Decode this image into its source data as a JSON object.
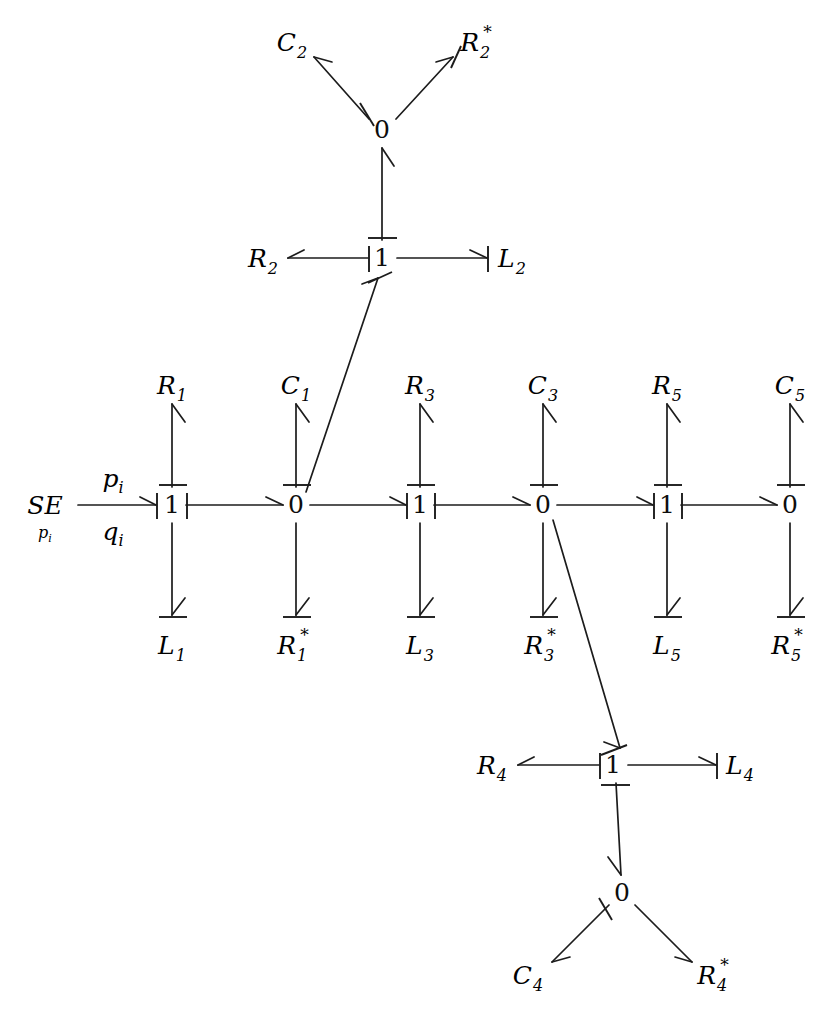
{
  "diagram": {
    "kind": "bond-graph",
    "title": "",
    "stroke_color": "#1c1c1c",
    "text_color": "#0d0d0d",
    "background": "#ffffff",
    "source": {
      "label": "SE",
      "subscript": "p",
      "subscript_sub": "i",
      "bond_effort_label": "p",
      "bond_effort_sub": "i",
      "bond_flow_label": "q",
      "bond_flow_sub": "i"
    },
    "junctions": {
      "main_row": [
        "1",
        "0",
        "1",
        "0",
        "1",
        "0"
      ],
      "top_one": "1",
      "top_zero": "0",
      "bottom_one": "1",
      "bottom_zero": "0"
    },
    "elements": {
      "top_row": [
        {
          "base": "R",
          "sub": "1",
          "star": false
        },
        {
          "base": "C",
          "sub": "1",
          "star": false
        },
        {
          "base": "R",
          "sub": "3",
          "star": false
        },
        {
          "base": "C",
          "sub": "3",
          "star": false
        },
        {
          "base": "R",
          "sub": "5",
          "star": false
        },
        {
          "base": "C",
          "sub": "5",
          "star": false
        }
      ],
      "bottom_row": [
        {
          "base": "L",
          "sub": "1",
          "star": false
        },
        {
          "base": "R",
          "sub": "1",
          "star": true
        },
        {
          "base": "L",
          "sub": "3",
          "star": false
        },
        {
          "base": "R",
          "sub": "3",
          "star": true
        },
        {
          "base": "L",
          "sub": "5",
          "star": false
        },
        {
          "base": "R",
          "sub": "5",
          "star": true
        }
      ],
      "top_cluster": [
        {
          "base": "C",
          "sub": "2",
          "star": false
        },
        {
          "base": "R",
          "sub": "2",
          "star": true
        },
        {
          "base": "R",
          "sub": "2",
          "star": false
        },
        {
          "base": "L",
          "sub": "2",
          "star": false
        }
      ],
      "bottom_cluster": [
        {
          "base": "C",
          "sub": "4",
          "star": false
        },
        {
          "base": "R",
          "sub": "4",
          "star": true
        },
        {
          "base": "R",
          "sub": "4",
          "star": false
        },
        {
          "base": "L",
          "sub": "4",
          "star": false
        }
      ]
    },
    "labels": {
      "SE": "SE",
      "p_i": "pi",
      "q_i": "qi",
      "R1": "R1",
      "C1": "C1",
      "R3": "R3",
      "C3": "C3",
      "R5": "R5",
      "C5": "C5",
      "L1": "L1",
      "R1s": "R1*",
      "L3": "L3",
      "R3s": "R3*",
      "L5": "L5",
      "R5s": "R5*",
      "C2": "C2",
      "R2s": "R2*",
      "R2": "R2",
      "L2": "L2",
      "C4": "C4",
      "R4s": "R4*",
      "R4": "R4",
      "L4": "L4",
      "one": "1",
      "zero": "0"
    }
  }
}
